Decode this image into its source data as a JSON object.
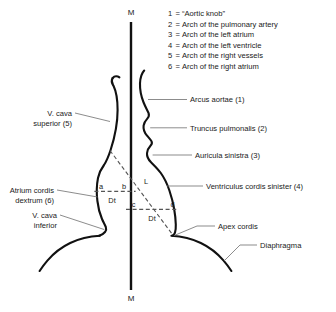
{
  "figure": {
    "midline": {
      "top_label": "M",
      "bottom_label": "M"
    },
    "legend": {
      "items": [
        {
          "key": "1",
          "eq": "=",
          "text": "“Aortic knob”"
        },
        {
          "key": "2",
          "eq": "=",
          "text": "Arch of the pulmonary artery"
        },
        {
          "key": "3",
          "eq": "=",
          "text": "Arch of the left atrium"
        },
        {
          "key": "4",
          "eq": "=",
          "text": "Arch of the left ventricle"
        },
        {
          "key": "5",
          "eq": "=",
          "text": "Arch of the right vessels"
        },
        {
          "key": "6",
          "eq": "=",
          "text": "Arch of the right atrium"
        }
      ]
    },
    "labels_right": [
      {
        "name": "arcus-aortae",
        "text": "Arcus aortae (1)"
      },
      {
        "name": "truncus-pulmonalis",
        "text": "Truncus pulmonalis (2)"
      },
      {
        "name": "auricula-sinistra",
        "text": "Auricula sinistra (3)"
      },
      {
        "name": "ventriculus-cordis-sinister",
        "text": "Ventriculus cordis sinister (4)"
      },
      {
        "name": "apex-cordis",
        "text": "Apex cordis"
      },
      {
        "name": "diaphragma",
        "text": "Diaphragma"
      }
    ],
    "labels_left": [
      {
        "name": "v-cava-superior",
        "line1": "V. cava",
        "line2": "superior (5)"
      },
      {
        "name": "atrium-cordis-dextrum",
        "line1": "Atrium cordis",
        "line2": "dextrum (6)"
      },
      {
        "name": "v-cava-inferior",
        "line1": "V. cava",
        "line2": "inferior"
      }
    ],
    "measurements": [
      {
        "name": "segment-a",
        "text": "a"
      },
      {
        "name": "segment-b",
        "text": "b"
      },
      {
        "name": "segment-c",
        "text": "c"
      },
      {
        "name": "segment-d",
        "text": "d"
      },
      {
        "name": "long-axis-L",
        "text": "L"
      },
      {
        "name": "transverse-dt-upper",
        "text": "Dt"
      },
      {
        "name": "transverse-dt-lower",
        "text": "Dt"
      }
    ],
    "colors": {
      "contour": "#111111",
      "midline": "#111111",
      "dashed": "#555555",
      "leader": "#777777",
      "text": "#1a1a1a",
      "background": "#ffffff"
    }
  }
}
